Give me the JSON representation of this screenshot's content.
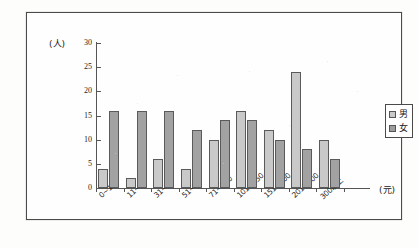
{
  "chart_data": {
    "type": "bar",
    "title": "",
    "subtitle": "",
    "xlabel": "(元)",
    "ylabel": "(人)",
    "ylim": [
      0,
      30
    ],
    "yticks": [
      0,
      5,
      10,
      15,
      20,
      25,
      30
    ],
    "grid": false,
    "legend_position": "right",
    "categories": [
      "0~10",
      "11~30",
      "31~50",
      "51~70",
      "71~100",
      "101~150",
      "151~200",
      "201~300",
      "300以上"
    ],
    "series": [
      {
        "name": "男",
        "color": "#c9c9c9",
        "values": [
          4,
          2,
          6,
          4,
          10,
          16,
          12,
          24,
          10
        ]
      },
      {
        "name": "女",
        "color": "#a2a2a2",
        "values": [
          16,
          16,
          16,
          12,
          14,
          14,
          10,
          8,
          6
        ]
      }
    ]
  },
  "axes": {
    "y_unit_label": "(人)",
    "x_unit_label": "(元)",
    "y_tick_labels": [
      "0",
      "5",
      "10",
      "15",
      "20",
      "25",
      "30"
    ]
  },
  "legend": {
    "items": [
      {
        "label": "男",
        "swatch": "male-swatch"
      },
      {
        "label": "女",
        "swatch": "female-swatch"
      }
    ]
  }
}
